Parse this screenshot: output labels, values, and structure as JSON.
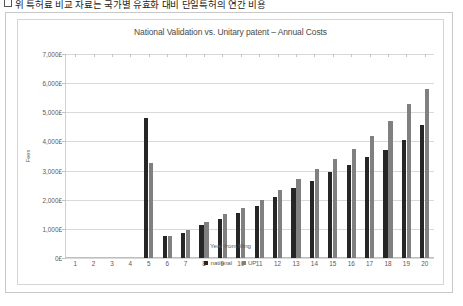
{
  "caption": {
    "text": "위 특허료 비교 자료는 국가별 유효화 대비 단일특허의 연간 비용"
  },
  "chart_frame": {
    "title": "National Validation vs. Unitary patent – Annual Costs"
  },
  "legend": {
    "position": "bottom",
    "entries": [
      {
        "label": "national",
        "color": "#262626"
      },
      {
        "label": "UP",
        "color": "#808080"
      }
    ]
  },
  "chart_data": {
    "type": "bar",
    "title": "National Validation vs. Unitary patent – Annual Costs",
    "xlabel": "Year from filing",
    "ylabel": "Fees",
    "grid": true,
    "legend_position": "bottom",
    "ylim": [
      0,
      7000
    ],
    "yticks": [
      0,
      1000,
      2000,
      3000,
      4000,
      5000,
      6000,
      7000
    ],
    "ytick_labels": [
      "0£",
      "1,000£",
      "2,000£",
      "3,000£",
      "4,000£",
      "5,000£",
      "6,000£",
      "7,000£"
    ],
    "categories": [
      "1",
      "2",
      "3",
      "4",
      "5",
      "6",
      "7",
      "8",
      "9",
      "10",
      "11",
      "12",
      "13",
      "14",
      "15",
      "16",
      "17",
      "18",
      "19",
      "20"
    ],
    "series": [
      {
        "name": "national",
        "color": "#262626",
        "values": [
          0,
          0,
          0,
          0,
          4800,
          750,
          850,
          1150,
          1350,
          1550,
          1800,
          2100,
          2400,
          2650,
          2950,
          3200,
          3450,
          3700,
          4050,
          4550
        ]
      },
      {
        "name": "UP",
        "color": "#808080",
        "values": [
          0,
          0,
          0,
          0,
          3250,
          760,
          960,
          1250,
          1500,
          1700,
          2000,
          2350,
          2700,
          3050,
          3400,
          3750,
          4200,
          4700,
          5300,
          5800
        ]
      }
    ]
  }
}
